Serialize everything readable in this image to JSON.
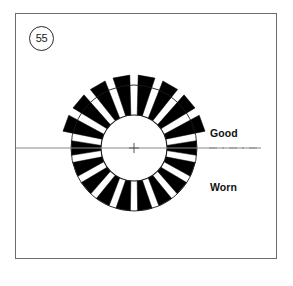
{
  "figure": {
    "number": "55",
    "badge_name": "figure-number-55"
  },
  "labels": {
    "good": "Good",
    "worn": "Worn"
  },
  "colors": {
    "tooth_fill": "#000000",
    "outline": "#1a1a1a",
    "panel_border": "#6b6b6b",
    "centerline": "#8a8a8a",
    "background": "#ffffff"
  },
  "diagram": {
    "type": "technical-illustration",
    "center_x": 118,
    "center_y": 134,
    "hub_radius": 33,
    "outer_circle_radius": 63,
    "tooth_count": 18,
    "good_tooth_outer_radius": 73,
    "worn_tooth_outer_radius": 63,
    "tooth_inner_radius": 33,
    "tooth_angular_width_deg": 11,
    "good_zone_deg": [
      180,
      360
    ],
    "worn_zone_deg": [
      0,
      180
    ],
    "centerline_style": "dash-dot",
    "centerline_y": 134,
    "centerline_x_start": -10,
    "centerline_x_end": 245,
    "center_cross_size": 5
  }
}
